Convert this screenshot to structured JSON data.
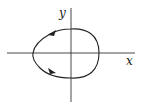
{
  "diagram": {
    "type": "phase-portrait",
    "axes": {
      "x_label": "x",
      "y_label": "y",
      "origin_px": [
        71,
        53
      ],
      "x_axis_px": [
        7,
        135
      ],
      "y_axis_px": [
        8,
        102
      ]
    },
    "curve": {
      "kind": "closed-loop",
      "shape": "egg / rounded, pointier on left",
      "extent_px": {
        "left": 33,
        "right": 99,
        "top": 29,
        "bottom": 78
      },
      "direction": "counterclockwise",
      "arrows": [
        {
          "position": "upper-left",
          "pointing": "down-left"
        },
        {
          "position": "lower-left",
          "pointing": "down-right"
        }
      ]
    },
    "colors": {
      "line": "#222222",
      "background": "#ffffff"
    }
  }
}
